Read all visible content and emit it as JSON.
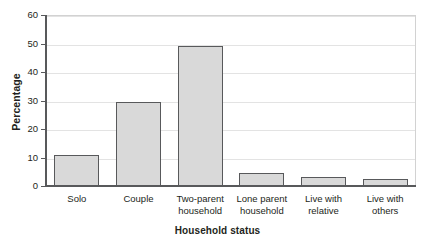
{
  "chart_data": {
    "type": "bar",
    "title": "",
    "xlabel": "Household status",
    "ylabel": "Percentage",
    "categories": [
      "Solo",
      "Couple",
      "Two-parent\nhousehold",
      "Lone parent\nhousehold",
      "Live with\nrelative",
      "Live with\nothers"
    ],
    "values": [
      11,
      29.5,
      49,
      4.5,
      3.3,
      2.3
    ],
    "ylim": [
      0,
      60
    ],
    "yticks": [
      0,
      10,
      20,
      30,
      40,
      50,
      60
    ],
    "ytick_labels": [
      "0",
      "10",
      "20",
      "30",
      "40",
      "50",
      "60"
    ],
    "grid": true,
    "legend": "none",
    "bar_fill_color": "#d9d9d9",
    "bar_border_color": "#58595b",
    "axis_color": "#58595b",
    "gridline_color": "#e3e3e3"
  },
  "figure": {
    "clipped_title_sliver": " "
  }
}
